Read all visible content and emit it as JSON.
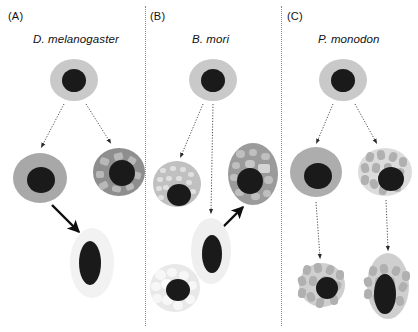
{
  "figure": {
    "width": 418,
    "height": 332,
    "background": "#ffffff"
  },
  "panels": [
    {
      "letter": "(A)",
      "letter_x": 8,
      "letter_y": 10,
      "species": "D. melanogaster",
      "species_x": 33,
      "species_y": 33,
      "divider_x": null
    },
    {
      "letter": "(B)",
      "letter_x": 150,
      "letter_y": 10,
      "species": "B. mori",
      "species_x": 192,
      "species_y": 33,
      "divider_x": 145
    },
    {
      "letter": "(C)",
      "letter_x": 287,
      "letter_y": 10,
      "species": "P. monodon",
      "species_x": 318,
      "species_y": 33,
      "divider_x": 281
    }
  ],
  "colors": {
    "nucleus": "#1a1a1a",
    "stem_cytoplasm": "#c9c9c9",
    "plain_gray_cytoplasm": "#a8a8a8",
    "dark_granular_cytoplasm": "#8e8e8e",
    "light_granular_cytoplasm": "#e3e3e3",
    "pale_cytoplasm": "#f2f2f2",
    "granule_dark": "#bdbdbd",
    "granule_light": "#f7f7f7",
    "arrow_solid": "#0d0d0d",
    "arrow_dotted": "#4d4d4d",
    "divider": "#8a8a8a",
    "text": "#111111"
  },
  "cells": [
    {
      "id": "a-stem",
      "name": "stem-cell-drosophila",
      "panel": "A",
      "cx": 74,
      "cy": 80,
      "rx": 24,
      "ry": 21,
      "fill": "#c9c9c9",
      "nucleus_dx": 0,
      "nucleus_dy": 0,
      "nucleus_rx": 12,
      "nucleus_ry": 11.5,
      "texture": "none"
    },
    {
      "id": "a-left",
      "name": "plasmatocyte-drosophila",
      "panel": "A",
      "cx": 40,
      "cy": 178,
      "rx": 27,
      "ry": 25,
      "fill": "#a8a8a8",
      "nucleus_dx": 1,
      "nucleus_dy": 2,
      "nucleus_rx": 14,
      "nucleus_ry": 13,
      "texture": "none"
    },
    {
      "id": "a-right",
      "name": "crystal-cell-drosophila",
      "panel": "A",
      "cx": 119,
      "cy": 172,
      "rx": 26,
      "ry": 24,
      "fill": "#8e8e8e",
      "nucleus_dx": 3,
      "nucleus_dy": 1,
      "nucleus_rx": 13,
      "nucleus_ry": 13,
      "texture": "angular"
    },
    {
      "id": "a-bottom",
      "name": "lamellocyte-drosophila",
      "panel": "A",
      "cx": 92,
      "cy": 263,
      "rx": 22,
      "ry": 35,
      "fill": "#f2f2f2",
      "nucleus_dx": -2,
      "nucleus_dy": 0,
      "nucleus_rx": 11,
      "nucleus_ry": 22,
      "texture": "none"
    },
    {
      "id": "b-stem",
      "name": "stem-cell-bombyx",
      "panel": "B",
      "cx": 213,
      "cy": 80,
      "rx": 24,
      "ry": 21,
      "fill": "#c9c9c9",
      "nucleus_dx": 0,
      "nucleus_dy": 0,
      "nucleus_rx": 12,
      "nucleus_ry": 11.5,
      "texture": "none"
    },
    {
      "id": "b-left",
      "name": "granulocyte-bombyx",
      "panel": "B",
      "cx": 177,
      "cy": 184,
      "rx": 24,
      "ry": 23,
      "fill": "#c0c0c0",
      "nucleus_dx": 2,
      "nucleus_dy": 11,
      "nucleus_rx": 12,
      "nucleus_ry": 11,
      "texture": "fine"
    },
    {
      "id": "b-right",
      "name": "spherulocyte-bombyx",
      "panel": "B",
      "cx": 253,
      "cy": 174,
      "rx": 25,
      "ry": 31,
      "fill": "#9b9b9b",
      "nucleus_dx": -3,
      "nucleus_dy": 7,
      "nucleus_rx": 13,
      "nucleus_ry": 13,
      "texture": "blobs"
    },
    {
      "id": "b-center",
      "name": "plasmatocyte-bombyx",
      "panel": "B",
      "cx": 211,
      "cy": 251,
      "rx": 20,
      "ry": 33,
      "fill": "#efefef",
      "nucleus_dx": 1,
      "nucleus_dy": 3,
      "nucleus_rx": 10,
      "nucleus_ry": 19,
      "texture": "none"
    },
    {
      "id": "b-bottom",
      "name": "oenocytoid-bombyx",
      "panel": "B",
      "cx": 175,
      "cy": 288,
      "rx": 25,
      "ry": 24,
      "fill": "#e8e8e8",
      "nucleus_dx": 3,
      "nucleus_dy": 2,
      "nucleus_rx": 12,
      "nucleus_ry": 11,
      "texture": "bubbles"
    },
    {
      "id": "c-stem",
      "name": "stem-cell-penaeus",
      "panel": "C",
      "cx": 343,
      "cy": 80,
      "rx": 24,
      "ry": 21,
      "fill": "#c9c9c9",
      "nucleus_dx": 0,
      "nucleus_dy": 0,
      "nucleus_rx": 12,
      "nucleus_ry": 11.5,
      "texture": "none"
    },
    {
      "id": "c-left",
      "name": "hyaline-cell-penaeus",
      "panel": "C",
      "cx": 316,
      "cy": 172,
      "rx": 26,
      "ry": 25,
      "fill": "#adadad",
      "nucleus_dx": 2,
      "nucleus_dy": 4,
      "nucleus_rx": 14,
      "nucleus_ry": 13,
      "texture": "none"
    },
    {
      "id": "c-right",
      "name": "semigranular-cell-penaeus",
      "panel": "C",
      "cx": 385,
      "cy": 172,
      "rx": 27,
      "ry": 24,
      "fill": "#dcdcdc",
      "nucleus_dx": 6,
      "nucleus_dy": 7,
      "nucleus_rx": 13,
      "nucleus_ry": 12,
      "texture": "ovals"
    },
    {
      "id": "c-bottom-left",
      "name": "granular-cell-penaeus",
      "panel": "C",
      "cx": 322,
      "cy": 285,
      "rx": 23,
      "ry": 22,
      "fill": "#cfcfcf",
      "nucleus_dx": 5,
      "nucleus_dy": 3,
      "nucleus_rx": 11,
      "nucleus_ry": 11,
      "texture": "ovals"
    },
    {
      "id": "c-bottom-right",
      "name": "elongated-granular-cell-penaeus",
      "panel": "C",
      "cx": 388,
      "cy": 286,
      "rx": 21,
      "ry": 33,
      "fill": "#cfcfcf",
      "nucleus_dx": -3,
      "nucleus_dy": 8,
      "nucleus_rx": 11,
      "nucleus_ry": 20,
      "texture": "ovals"
    }
  ],
  "arrows": [
    {
      "id": "a1",
      "name": "arrow-stem-to-plasmatocyte-drosophila",
      "style": "dotted",
      "x1": 64,
      "y1": 104,
      "x2": 42,
      "y2": 146
    },
    {
      "id": "a2",
      "name": "arrow-stem-to-crystal-drosophila",
      "style": "dotted",
      "x1": 86,
      "y1": 104,
      "x2": 110,
      "y2": 142
    },
    {
      "id": "a3",
      "name": "arrow-plasmatocyte-to-lamellocyte-drosophila",
      "style": "solid",
      "x1": 52,
      "y1": 205,
      "x2": 79,
      "y2": 232
    },
    {
      "id": "b1",
      "name": "arrow-stem-to-granulocyte-bombyx",
      "style": "dotted",
      "x1": 203,
      "y1": 104,
      "x2": 181,
      "y2": 156
    },
    {
      "id": "b2",
      "name": "arrow-stem-to-oenocytoid-bombyx",
      "style": "dotted",
      "x1": 213,
      "y1": 104,
      "x2": 211,
      "y2": 212
    },
    {
      "id": "b3",
      "name": "arrow-plasmatocyte-to-spherulocyte-bombyx",
      "style": "solid",
      "x1": 222,
      "y1": 228,
      "x2": 243,
      "y2": 207
    },
    {
      "id": "c1",
      "name": "arrow-stem-to-hyaline-penaeus",
      "style": "dotted",
      "x1": 333,
      "y1": 104,
      "x2": 317,
      "y2": 142
    },
    {
      "id": "c2",
      "name": "arrow-stem-to-semigranular-penaeus",
      "style": "dotted",
      "x1": 355,
      "y1": 104,
      "x2": 376,
      "y2": 142
    },
    {
      "id": "c3",
      "name": "arrow-hyaline-to-granular-penaeus",
      "style": "dotted",
      "x1": 316,
      "y1": 202,
      "x2": 320,
      "y2": 257
    },
    {
      "id": "c4",
      "name": "arrow-semigranular-to-elongated-penaeus",
      "style": "dotted",
      "x1": 386,
      "y1": 200,
      "x2": 388,
      "y2": 249
    }
  ],
  "textures": {
    "angular": [
      {
        "dx": -15,
        "dy": -11,
        "w": 9,
        "h": 7,
        "r": 2,
        "fill": "#b8b8b8",
        "rot": 20
      },
      {
        "dx": -1,
        "dy": -16,
        "w": 9,
        "h": 7,
        "r": 2,
        "fill": "#b8b8b8",
        "rot": -15
      },
      {
        "dx": 13,
        "dy": -12,
        "w": 8,
        "h": 7,
        "r": 2,
        "fill": "#b8b8b8",
        "rot": 30
      },
      {
        "dx": -19,
        "dy": 2,
        "w": 8,
        "h": 7,
        "r": 2,
        "fill": "#b8b8b8",
        "rot": 0
      },
      {
        "dx": -16,
        "dy": 13,
        "w": 9,
        "h": 7,
        "r": 2,
        "fill": "#b8b8b8",
        "rot": -25
      },
      {
        "dx": -3,
        "dy": 17,
        "w": 9,
        "h": 6,
        "r": 2,
        "fill": "#b8b8b8",
        "rot": 10
      },
      {
        "dx": 11,
        "dy": 15,
        "w": 8,
        "h": 6,
        "r": 2,
        "fill": "#b8b8b8",
        "rot": -20
      },
      {
        "dx": 18,
        "dy": 3,
        "w": 8,
        "h": 7,
        "r": 2,
        "fill": "#b8b8b8",
        "rot": 15
      }
    ],
    "fine": [
      {
        "dx": -14,
        "dy": -14,
        "w": 6,
        "h": 5,
        "r": 3,
        "fill": "#e0e0e0",
        "rot": 0
      },
      {
        "dx": -4,
        "dy": -16,
        "w": 6,
        "h": 5,
        "r": 3,
        "fill": "#e0e0e0",
        "rot": 0
      },
      {
        "dx": 6,
        "dy": -15,
        "w": 6,
        "h": 5,
        "r": 3,
        "fill": "#e0e0e0",
        "rot": 0
      },
      {
        "dx": 14,
        "dy": -10,
        "w": 6,
        "h": 5,
        "r": 3,
        "fill": "#e0e0e0",
        "rot": 0
      },
      {
        "dx": -17,
        "dy": -5,
        "w": 6,
        "h": 5,
        "r": 3,
        "fill": "#e0e0e0",
        "rot": 0
      },
      {
        "dx": -8,
        "dy": -6,
        "w": 6,
        "h": 5,
        "r": 3,
        "fill": "#e0e0e0",
        "rot": 0
      },
      {
        "dx": 2,
        "dy": -6,
        "w": 6,
        "h": 5,
        "r": 3,
        "fill": "#e0e0e0",
        "rot": 0
      },
      {
        "dx": 12,
        "dy": -2,
        "w": 6,
        "h": 5,
        "r": 3,
        "fill": "#e0e0e0",
        "rot": 0
      },
      {
        "dx": -18,
        "dy": 4,
        "w": 6,
        "h": 5,
        "r": 3,
        "fill": "#e0e0e0",
        "rot": 0
      },
      {
        "dx": -11,
        "dy": 3,
        "w": 6,
        "h": 5,
        "r": 3,
        "fill": "#e0e0e0",
        "rot": 0
      },
      {
        "dx": 16,
        "dy": 7,
        "w": 6,
        "h": 5,
        "r": 3,
        "fill": "#e0e0e0",
        "rot": 0
      },
      {
        "dx": -16,
        "dy": 13,
        "w": 6,
        "h": 5,
        "r": 3,
        "fill": "#e0e0e0",
        "rot": 0
      }
    ],
    "blobs": [
      {
        "dx": -13,
        "dy": -20,
        "w": 9,
        "h": 8,
        "r": 4,
        "fill": "#bfbfbf",
        "rot": 0
      },
      {
        "dx": 0,
        "dy": -22,
        "w": 8,
        "h": 7,
        "r": 4,
        "fill": "#bfbfbf",
        "rot": 0
      },
      {
        "dx": 12,
        "dy": -18,
        "w": 9,
        "h": 7,
        "r": 4,
        "fill": "#bfbfbf",
        "rot": 0
      },
      {
        "dx": -17,
        "dy": -9,
        "w": 8,
        "h": 7,
        "r": 4,
        "fill": "#bfbfbf",
        "rot": 0
      },
      {
        "dx": -3,
        "dy": -10,
        "w": 10,
        "h": 8,
        "r": 4,
        "fill": "#c7c7c7",
        "rot": 0
      },
      {
        "dx": 11,
        "dy": -6,
        "w": 12,
        "h": 9,
        "r": 2,
        "fill": "#d4d4d4",
        "rot": 0
      },
      {
        "dx": -19,
        "dy": 3,
        "w": 8,
        "h": 7,
        "r": 4,
        "fill": "#bfbfbf",
        "rot": 0
      },
      {
        "dx": 15,
        "dy": 6,
        "w": 9,
        "h": 8,
        "r": 4,
        "fill": "#bfbfbf",
        "rot": 0
      },
      {
        "dx": -14,
        "dy": 18,
        "w": 9,
        "h": 7,
        "r": 4,
        "fill": "#bfbfbf",
        "rot": 0
      },
      {
        "dx": 2,
        "dy": 22,
        "w": 9,
        "h": 7,
        "r": 4,
        "fill": "#bfbfbf",
        "rot": 0
      },
      {
        "dx": 14,
        "dy": 19,
        "w": 8,
        "h": 7,
        "r": 4,
        "fill": "#bfbfbf",
        "rot": 0
      }
    ],
    "bubbles": [
      {
        "dx": -15,
        "dy": -13,
        "w": 11,
        "h": 10,
        "r": 6,
        "fill": "#f7f7f7",
        "rot": 0
      },
      {
        "dx": -3,
        "dy": -16,
        "w": 10,
        "h": 9,
        "r": 5,
        "fill": "#f7f7f7",
        "rot": 0
      },
      {
        "dx": 9,
        "dy": -13,
        "w": 10,
        "h": 9,
        "r": 5,
        "fill": "#f7f7f7",
        "rot": 0
      },
      {
        "dx": -19,
        "dy": -2,
        "w": 10,
        "h": 9,
        "r": 5,
        "fill": "#f7f7f7",
        "rot": 0
      },
      {
        "dx": -9,
        "dy": -4,
        "w": 11,
        "h": 10,
        "r": 6,
        "fill": "#fafafa",
        "rot": 0
      },
      {
        "dx": 17,
        "dy": -3,
        "w": 9,
        "h": 9,
        "r": 5,
        "fill": "#f7f7f7",
        "rot": 0
      },
      {
        "dx": -18,
        "dy": 10,
        "w": 10,
        "h": 9,
        "r": 5,
        "fill": "#f7f7f7",
        "rot": 0
      },
      {
        "dx": -8,
        "dy": 12,
        "w": 11,
        "h": 10,
        "r": 6,
        "fill": "#f7f7f7",
        "rot": 0
      },
      {
        "dx": 3,
        "dy": 17,
        "w": 10,
        "h": 9,
        "r": 5,
        "fill": "#f7f7f7",
        "rot": 0
      },
      {
        "dx": 15,
        "dy": 11,
        "w": 10,
        "h": 9,
        "r": 5,
        "fill": "#f7f7f7",
        "rot": 0
      }
    ],
    "ovals": [
      {
        "dx": -15,
        "dy": -15,
        "w": 8,
        "h": 10,
        "r": 5,
        "fill": "#b0b0b0",
        "rot": 15
      },
      {
        "dx": -4,
        "dy": -17,
        "w": 8,
        "h": 10,
        "r": 5,
        "fill": "#b0b0b0",
        "rot": -10
      },
      {
        "dx": 8,
        "dy": -15,
        "w": 8,
        "h": 10,
        "r": 5,
        "fill": "#b0b0b0",
        "rot": 20
      },
      {
        "dx": 18,
        "dy": -10,
        "w": 8,
        "h": 10,
        "r": 5,
        "fill": "#b0b0b0",
        "rot": 0
      },
      {
        "dx": -20,
        "dy": -4,
        "w": 8,
        "h": 10,
        "r": 5,
        "fill": "#b0b0b0",
        "rot": -15
      },
      {
        "dx": -9,
        "dy": -4,
        "w": 8,
        "h": 10,
        "r": 5,
        "fill": "#b0b0b0",
        "rot": 10
      },
      {
        "dx": 3,
        "dy": -4,
        "w": 8,
        "h": 10,
        "r": 5,
        "fill": "#b0b0b0",
        "rot": -5
      },
      {
        "dx": 15,
        "dy": 1,
        "w": 8,
        "h": 10,
        "r": 5,
        "fill": "#b0b0b0",
        "rot": 25
      },
      {
        "dx": -20,
        "dy": 8,
        "w": 8,
        "h": 10,
        "r": 5,
        "fill": "#b0b0b0",
        "rot": 5
      },
      {
        "dx": -11,
        "dy": 12,
        "w": 8,
        "h": 10,
        "r": 5,
        "fill": "#b0b0b0",
        "rot": -20
      },
      {
        "dx": -2,
        "dy": 18,
        "w": 8,
        "h": 10,
        "r": 5,
        "fill": "#b0b0b0",
        "rot": 12
      },
      {
        "dx": 12,
        "dy": 15,
        "w": 8,
        "h": 10,
        "r": 5,
        "fill": "#b0b0b0",
        "rot": -8
      }
    ]
  }
}
